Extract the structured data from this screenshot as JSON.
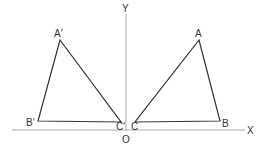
{
  "diagram": {
    "type": "reflection-about-y-axis",
    "axes": {
      "x_label": "X",
      "y_label": "Y",
      "origin_label": "O",
      "axis_color": "#999999"
    },
    "original_triangle": {
      "vertices": [
        {
          "label": "A",
          "x": 199,
          "y": 40
        },
        {
          "label": "B",
          "x": 220,
          "y": 121
        },
        {
          "label": "C",
          "x": 135,
          "y": 122
        }
      ]
    },
    "reflected_triangle": {
      "vertices": [
        {
          "label": "A′",
          "x": 60,
          "y": 40
        },
        {
          "label": "B′",
          "x": 38,
          "y": 121
        },
        {
          "label": "C′",
          "x": 121,
          "y": 122
        }
      ]
    },
    "stroke_color": "#333333"
  }
}
